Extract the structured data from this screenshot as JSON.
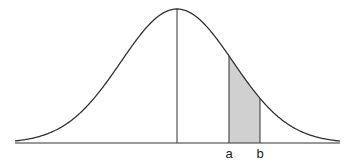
{
  "diagram": {
    "type": "normal-distribution-curve",
    "labels": {
      "a": "a",
      "b": "b"
    },
    "colors": {
      "stroke": "#333333",
      "shade": "#d0d0d0",
      "background": "#ffffff"
    },
    "geometry": {
      "baseline_y": 143,
      "x_start": 15,
      "x_end": 340,
      "mean_x": 177,
      "peak_y": 9,
      "sigma_px": 56,
      "a_x": 229,
      "b_x": 260
    }
  }
}
